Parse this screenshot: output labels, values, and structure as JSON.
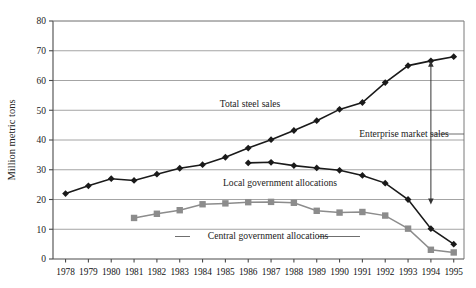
{
  "chart_data": {
    "type": "line",
    "title": "",
    "xlabel": "",
    "ylabel": "Million metric tons",
    "ylim": [
      0,
      80
    ],
    "ytick_step": 10,
    "grid": true,
    "legend_position": "inline-annotations",
    "categories": [
      "1978",
      "1979",
      "1980",
      "1981",
      "1982",
      "1983",
      "1984",
      "1985",
      "1986",
      "1987",
      "1988",
      "1989",
      "1990",
      "1991",
      "1992",
      "1993",
      "1994",
      "1995"
    ],
    "yticks": [
      "0",
      "10",
      "20",
      "30",
      "40",
      "50",
      "60",
      "70",
      "80"
    ],
    "series": [
      {
        "name": "Total steel sales",
        "marker": "diamond",
        "color": "#1a1a1a",
        "values": [
          22,
          24.6,
          27,
          26.4,
          28.5,
          30.5,
          31.7,
          34.2,
          37.3,
          40.1,
          43.2,
          46.5,
          50.3,
          52.6,
          59.3,
          65,
          66.6,
          68
        ]
      },
      {
        "name": "Local government allocations",
        "marker": "diamond",
        "color": "#1a1a1a",
        "values": [
          null,
          null,
          null,
          null,
          null,
          null,
          null,
          null,
          32.3,
          32.5,
          31.4,
          30.6,
          29.8,
          28.1,
          25.5,
          20,
          10.2,
          5
        ]
      },
      {
        "name": "Central government allocations",
        "marker": "square",
        "color": "#8c8c8c",
        "values": [
          null,
          null,
          null,
          13.8,
          15.2,
          16.4,
          18.4,
          18.7,
          19.1,
          19.2,
          18.9,
          16.2,
          15.6,
          15.8,
          14.6,
          10.2,
          3.1,
          2.2
        ]
      }
    ],
    "annotations": [
      {
        "name": "total-steel-sales-label",
        "text": "Total steel sales",
        "x": 250,
        "y": 107
      },
      {
        "name": "local-government-allocations-label",
        "text": "Local government allocations",
        "x": 280,
        "y": 186
      },
      {
        "name": "central-government-allocations-label",
        "text": "Central government allocations",
        "x": 268,
        "y": 239
      },
      {
        "name": "enterprise-market-sales-label",
        "text": "Enterprise market sales",
        "x": 404,
        "y": 137
      }
    ],
    "arrow_annotation": {
      "name": "enterprise-market-sales-arrow",
      "label": "Enterprise market sales",
      "at_category": "1994",
      "from_value": 66.6,
      "to_value": 20
    }
  }
}
